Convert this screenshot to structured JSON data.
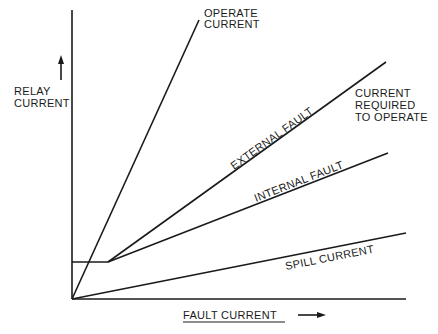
{
  "diagram": {
    "axes": {
      "y_label_line1": "RELAY",
      "y_label_line2": "CURRENT",
      "x_label": "FAULT CURRENT"
    },
    "curves": {
      "operate_current_line1": "OPERATE",
      "operate_current_line2": "CURRENT",
      "external_fault": "EXTERNAL FAULT",
      "internal_fault": "INTERNAL FAULT",
      "spill_current": "SPILL CURRENT"
    },
    "annotation": {
      "line1": "CURRENT",
      "line2": "REQUIRED",
      "line3": "TO OPERATE"
    },
    "colors": {
      "ink": "#1a1a1a",
      "background": "#ffffff"
    }
  }
}
